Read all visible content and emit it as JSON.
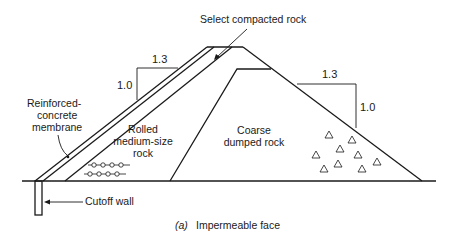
{
  "figure": {
    "caption_prefix": "(a)",
    "caption": "Impermeable face"
  },
  "labels": {
    "select_compacted_rock": "Select compacted rock",
    "reinforced_line1": "Reinforced-",
    "reinforced_line2": "concrete",
    "reinforced_line3": "membrane",
    "rolled_line1": "Rolled",
    "rolled_line2": "medium-size",
    "rolled_line3": "rock",
    "coarse_line1": "Coarse",
    "coarse_line2": "dumped rock",
    "cutoff_wall": "Cutoff wall"
  },
  "slopes": {
    "upstream": {
      "horizontal": "1.3",
      "vertical": "1.0"
    },
    "downstream": {
      "horizontal": "1.3",
      "vertical": "1.0"
    }
  },
  "symbols": {
    "rolled_rock_pattern": "circle-chain",
    "dumped_rock_pattern": "triangles"
  }
}
